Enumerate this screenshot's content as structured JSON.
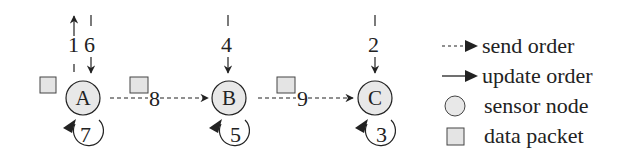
{
  "diagram": {
    "nodes": [
      {
        "id": "A",
        "label": "A"
      },
      {
        "id": "B",
        "label": "B"
      },
      {
        "id": "C",
        "label": "C"
      }
    ],
    "update_orders": {
      "A_up": "1",
      "A_down": "6",
      "A_self": "7",
      "B_down": "4",
      "B_self": "5",
      "C_down": "2",
      "C_self": "3"
    },
    "send_orders": {
      "A_to_B": "8",
      "B_to_C": "9"
    },
    "colors": {
      "node_fill": "#e8e8e8",
      "packet_fill": "#e4e4e4",
      "stroke": "#222222"
    }
  },
  "legend": {
    "send_order": "send order",
    "update_order": "update order",
    "sensor_node": "sensor node",
    "data_packet": "data packet"
  }
}
